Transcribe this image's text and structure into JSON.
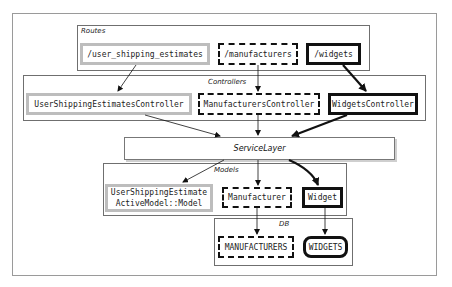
{
  "diagram": {
    "groups": {
      "routes": "Routes",
      "controllers": "Controllers",
      "models": "Models",
      "db": "DB"
    },
    "routes": [
      {
        "label": "/user_shipping_estimates",
        "style": "gray"
      },
      {
        "label": "/manufacturers",
        "style": "dashed"
      },
      {
        "label": "/widgets",
        "style": "bold"
      }
    ],
    "controllers": [
      {
        "label": "UserShippingEstimatesController",
        "style": "gray"
      },
      {
        "label": "ManufacturersController",
        "style": "dashed"
      },
      {
        "label": "WidgetsController",
        "style": "bold"
      }
    ],
    "service_layer": "ServiceLayer",
    "models": [
      {
        "label_line1": "UserShippingEstimate",
        "label_line2": "ActiveModel::Model",
        "style": "gray"
      },
      {
        "label": "Manufacturer",
        "style": "dashed"
      },
      {
        "label": "Widget",
        "style": "bold"
      }
    ],
    "db": [
      {
        "label": "MANUFACTURERS",
        "style": "dashed"
      },
      {
        "label": "WIDGETS",
        "style": "bold-cylinder"
      }
    ],
    "edges": [
      {
        "from": "/user_shipping_estimates",
        "to": "UserShippingEstimatesController"
      },
      {
        "from": "/manufacturers",
        "to": "ManufacturersController"
      },
      {
        "from": "/widgets",
        "to": "WidgetsController"
      },
      {
        "from": "UserShippingEstimatesController",
        "to": "ServiceLayer"
      },
      {
        "from": "ManufacturersController",
        "to": "ServiceLayer"
      },
      {
        "from": "WidgetsController",
        "to": "ServiceLayer"
      },
      {
        "from": "ServiceLayer",
        "to": "UserShippingEstimate"
      },
      {
        "from": "ServiceLayer",
        "to": "Manufacturer"
      },
      {
        "from": "ServiceLayer",
        "to": "Widget"
      },
      {
        "from": "Manufacturer",
        "to": "MANUFACTURERS"
      },
      {
        "from": "Widget",
        "to": "WIDGETS"
      }
    ],
    "colors": {
      "gray_node": "#bdbdbd",
      "dark_node": "#111111",
      "group_border": "#6f6f6f"
    }
  }
}
